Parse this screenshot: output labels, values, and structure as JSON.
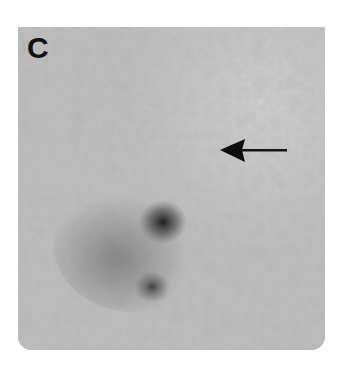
{
  "figure": {
    "panel_label": "C",
    "image_type": "grayscale micrograph",
    "annotations": [
      {
        "type": "arrow",
        "direction": "left",
        "tip": [
          220,
          150
        ],
        "tail": [
          285,
          150
        ]
      }
    ],
    "features": [
      {
        "name": "primary-dark-spot",
        "center": [
          163,
          222
        ]
      },
      {
        "name": "secondary-dark-spot",
        "center": [
          152,
          287
        ]
      }
    ],
    "colors": {
      "background": "#b9b9b9",
      "label": "#111111",
      "arrow": "#0d0d0d",
      "spot": "#1e1e1e"
    }
  }
}
